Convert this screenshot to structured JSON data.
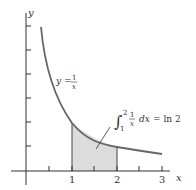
{
  "diagram": {
    "axes": {
      "x_label": "x",
      "y_label": "y",
      "x_ticks": [
        "1",
        "2",
        "3"
      ],
      "x_range": [
        0,
        3.2
      ],
      "y_tick_step": 0.5
    },
    "curve": {
      "equation_lhs": "y =",
      "equation_num": "1",
      "equation_den": "x",
      "function": "1/x",
      "domain": [
        0.333,
        3
      ]
    },
    "shaded_region": {
      "from": 1,
      "to": 2,
      "fill": "#dcdcdc"
    },
    "annotation": {
      "integral_sign": "∫",
      "upper": "2",
      "lower": "1",
      "integrand_num": "1",
      "integrand_den": "x",
      "dx": "dx",
      "rhs": "= ln 2"
    },
    "colors": {
      "curve": "#666666",
      "axes": "#333333",
      "shade": "#dcdcdc"
    }
  }
}
